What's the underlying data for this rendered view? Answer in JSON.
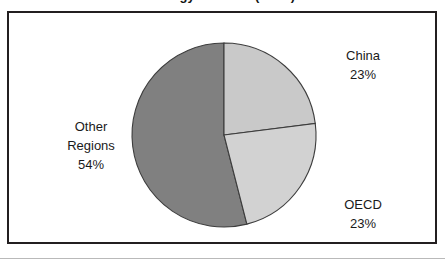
{
  "chart_data": {
    "type": "pie",
    "title": "Energy Demand (Mtoe)",
    "categories": [
      "China",
      "OECD",
      "Other Regions"
    ],
    "values": [
      23,
      23,
      54
    ],
    "value_suffix": "%",
    "start_angle_deg": 0,
    "direction": "clockwise",
    "legend": "none",
    "labels_position": "outside",
    "slices": [
      {
        "name": "China",
        "value": 23,
        "value_label": "23%",
        "color": "#c9c9c9",
        "start_deg": 0,
        "end_deg": 82.8
      },
      {
        "name": "OECD",
        "value": 23,
        "value_label": "23%",
        "color": "#d2d2d2",
        "start_deg": 82.8,
        "end_deg": 165.6
      },
      {
        "name": "Other Regions",
        "value": 54,
        "value_label": "54%",
        "color": "#808080",
        "start_deg": 165.6,
        "end_deg": 360
      }
    ]
  },
  "labels": {
    "china": {
      "name": "China",
      "value": "23%"
    },
    "oecd": {
      "name": "OECD",
      "value": "23%"
    },
    "other": {
      "line1": "Other",
      "line2": "Regions",
      "value": "54%"
    }
  },
  "colors": {
    "china": "#c9c9c9",
    "oecd": "#d2d2d2",
    "other_regions": "#808080",
    "slice_outline": "#3d3d3d",
    "frame_border": "#231f20",
    "background": "#ffffff"
  }
}
